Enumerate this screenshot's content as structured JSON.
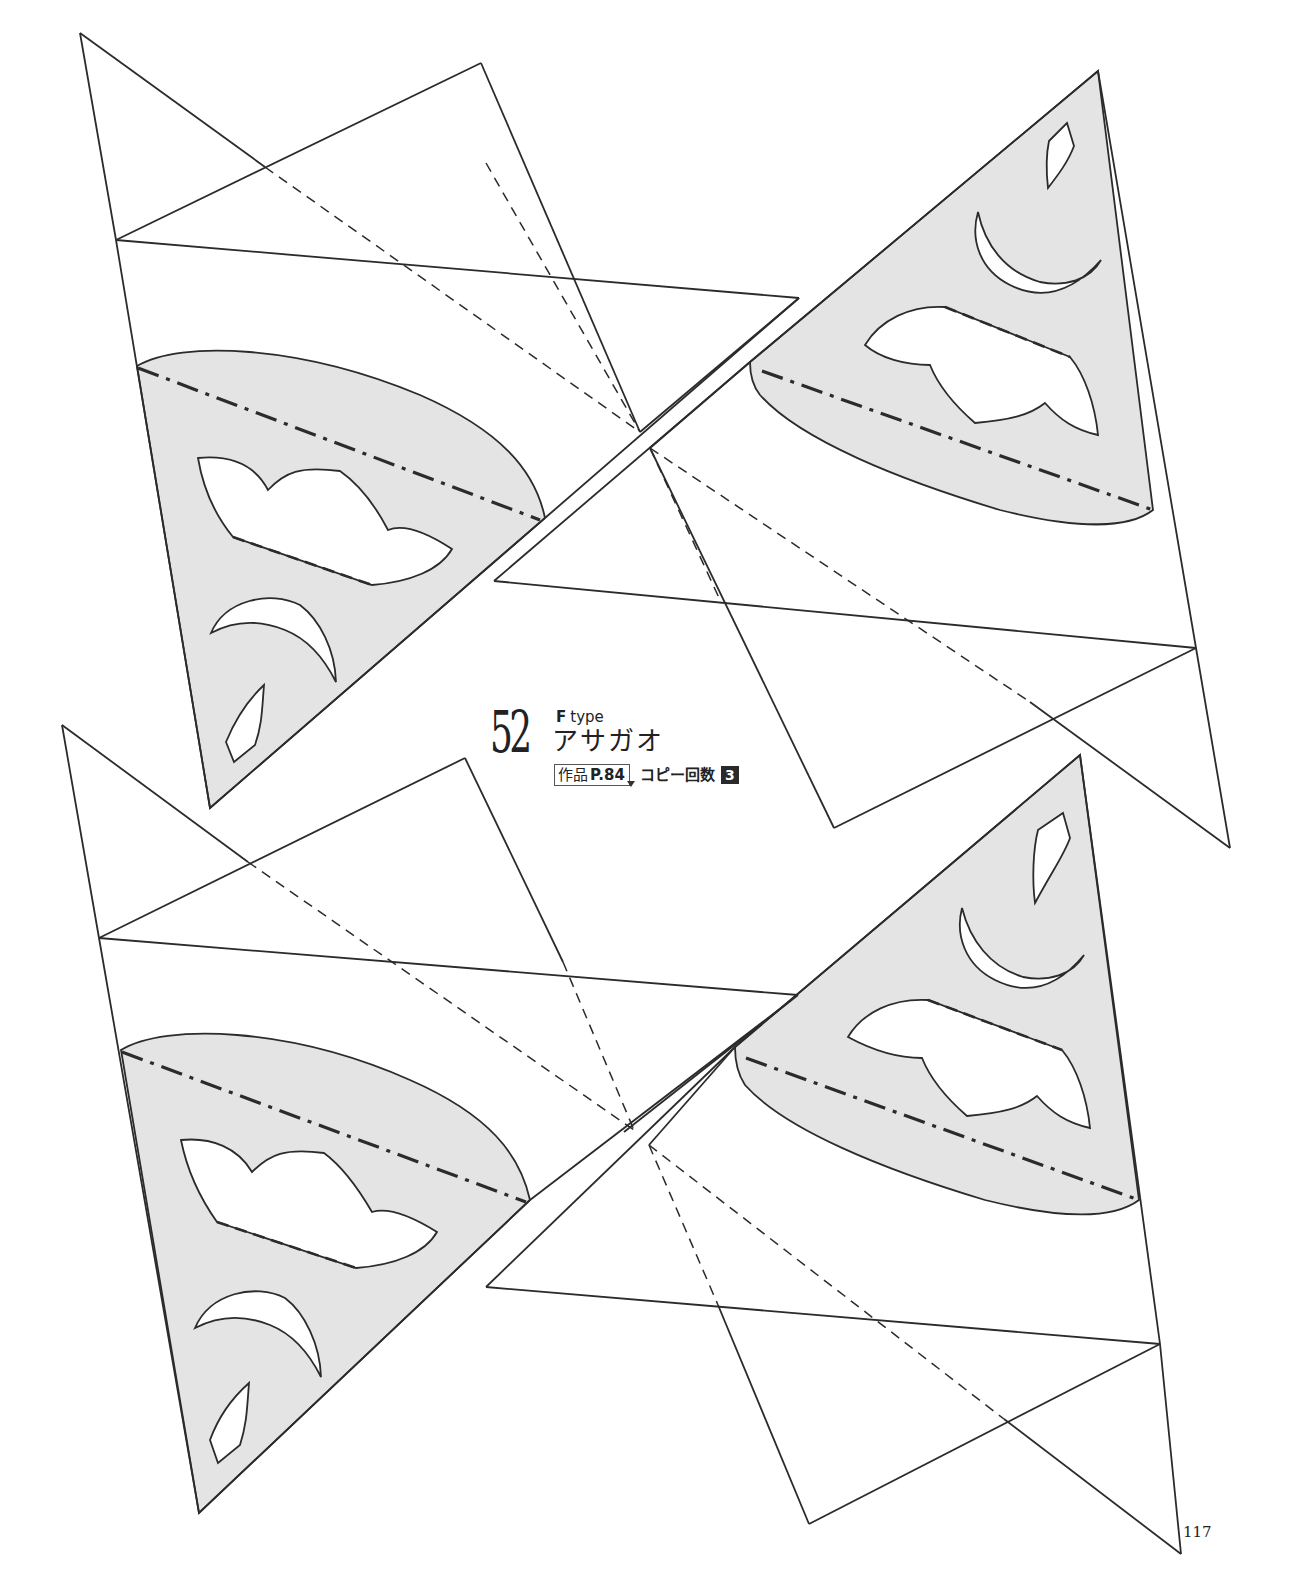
{
  "pattern": {
    "number": "52",
    "type_letter": "F",
    "type_word": "type",
    "title": "アサガオ",
    "work_ref_prefix": "作品",
    "work_ref_page": "P.84",
    "copy_count_label": "コピー回数",
    "copy_count": "3"
  },
  "page_number": "117",
  "colors": {
    "shade": "#e4e4e4",
    "line": "#2b2b2b",
    "badge": "#2a2a2a"
  },
  "legend_icons": {
    "cut_line": "solid-line",
    "valley_fold": "dashed-line",
    "mountain_fold": "dash-dot-line"
  },
  "templates": [
    {
      "id": "upper-left",
      "motifs": [
        "petal-cut",
        "crescent-cut",
        "diamond-cut"
      ]
    },
    {
      "id": "upper-right",
      "motifs": [
        "petal-cut",
        "crescent-cut",
        "diamond-cut"
      ]
    },
    {
      "id": "lower-left",
      "motifs": [
        "petal-cut",
        "crescent-cut",
        "diamond-cut"
      ]
    },
    {
      "id": "lower-right",
      "motifs": [
        "petal-cut",
        "crescent-cut",
        "diamond-cut"
      ]
    }
  ]
}
